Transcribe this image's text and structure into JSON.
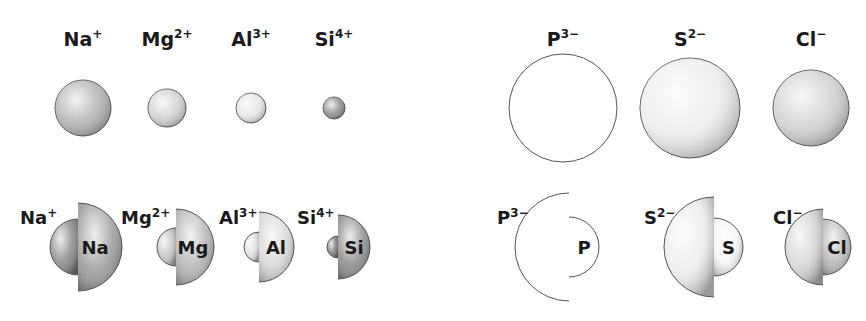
{
  "figure": {
    "cations": [
      {
        "symbol": "Na",
        "charge": "+",
        "ion_label": "Na",
        "ion_sup": "+",
        "atom_label": "Na",
        "cx": 83,
        "ion_r": 28,
        "atom_r": 44,
        "split_x": 78,
        "ion_color": "#8a8a8a",
        "atom_color": "#9a9a9a",
        "sphere_color": "#b0b0b0"
      },
      {
        "symbol": "Mg",
        "charge": "2+",
        "ion_label": "Mg",
        "ion_sup": "2+",
        "atom_label": "Mg",
        "cx": 167,
        "ion_r": 19,
        "atom_r": 38,
        "split_x": 176,
        "ion_color": "#c4c4c4",
        "atom_color": "#b4b4b4",
        "sphere_color": "#d0d0d0"
      },
      {
        "symbol": "Al",
        "charge": "3+",
        "ion_label": "Al",
        "ion_sup": "3+",
        "atom_label": "Al",
        "cx": 251,
        "ion_r": 15,
        "atom_r": 35,
        "split_x": 259,
        "ion_color": "#e0e0e0",
        "atom_color": "#d6d6d6",
        "sphere_color": "#e4e4e4"
      },
      {
        "symbol": "Si",
        "charge": "4+",
        "ion_label": "Si",
        "ion_sup": "4+",
        "atom_label": "Si",
        "cx": 334,
        "ion_r": 11,
        "atom_r": 32,
        "split_x": 338,
        "ion_color": "#7c7c7c",
        "atom_color": "#8c8c8c",
        "sphere_color": "#8a8a8a"
      }
    ],
    "anions": [
      {
        "symbol": "P",
        "charge": "3−",
        "ion_label": "P",
        "ion_sup": "3−",
        "atom_label": "P",
        "cx": 563,
        "ion_r": 54,
        "atom_r": 30,
        "split_x": 569,
        "ion_color": "#ffffff",
        "atom_color": "#ffffff",
        "sphere_color": "#ffffff"
      },
      {
        "symbol": "S",
        "charge": "2−",
        "ion_label": "S",
        "ion_sup": "2−",
        "atom_label": "S",
        "cx": 690,
        "ion_r": 50,
        "atom_r": 29,
        "split_x": 714,
        "ion_color": "#ececec",
        "atom_color": "#f4f4f4",
        "sphere_color": "#ececec"
      },
      {
        "symbol": "Cl",
        "charge": "−",
        "ion_label": "Cl",
        "ion_sup": "−",
        "atom_label": "Cl",
        "cx": 811,
        "ion_r": 38,
        "atom_r": 28,
        "split_x": 823,
        "ion_color": "#d4d4d4",
        "atom_color": "#b8b8b8",
        "sphere_color": "#cfcfcf"
      }
    ],
    "rows": {
      "label_y": 46,
      "sphere_y": 108,
      "compare_y": 247
    },
    "colors": {
      "outline": "#555555",
      "text": "#1a1a1a",
      "background": "#ffffff"
    }
  }
}
